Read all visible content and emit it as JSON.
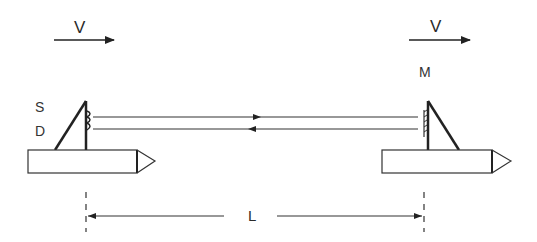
{
  "diagram": {
    "title": "",
    "labels": {
      "velocity_left": "V",
      "velocity_right": "V",
      "source": "S",
      "detector": "D",
      "mirror": "M",
      "distance": "L"
    },
    "nodes": [
      {
        "id": "left-vehicle",
        "type": "block-with-arrow-tip",
        "components": [
          "source S",
          "detector D"
        ]
      },
      {
        "id": "right-vehicle",
        "type": "block-with-arrow-tip",
        "components": [
          "mirror M"
        ]
      }
    ],
    "edges": [
      {
        "from": "S",
        "to": "M",
        "direction": "right",
        "label": ""
      },
      {
        "from": "M",
        "to": "D",
        "direction": "left",
        "label": ""
      }
    ],
    "dimensions": [
      {
        "label": "L",
        "from": "left-vehicle-sensor",
        "to": "right-vehicle-mirror"
      }
    ],
    "colors": {
      "stroke": "#222222",
      "background": "#ffffff"
    }
  }
}
